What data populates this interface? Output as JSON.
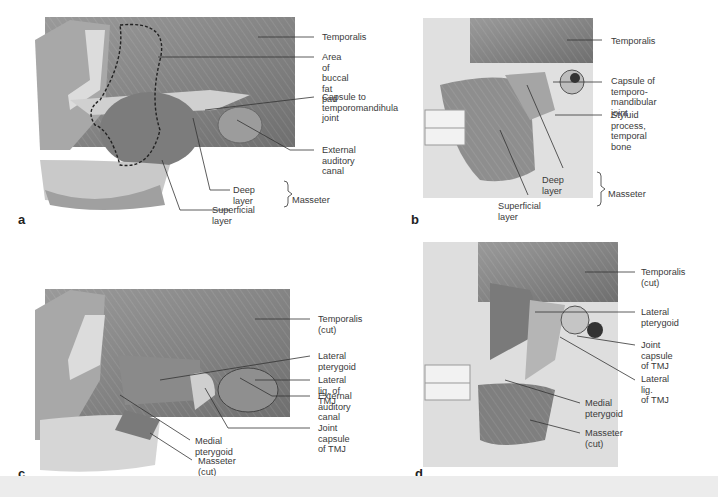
{
  "figure": {
    "panels": [
      {
        "letter": "a",
        "labels": {
          "temporalis": "Temporalis",
          "buccal": "Area of buccal\nfat pad",
          "capsule": "Capsule to\ntemporomandihula\njoint",
          "ear": "External auditory\ncanal",
          "deep": "Deep layer",
          "superficial": "Superficial layer",
          "masseter": "Masseter"
        }
      },
      {
        "letter": "b",
        "labels": {
          "temporalis": "Temporalis",
          "capsule": "Capsule of temporo-\nmandibular joint",
          "styloid": "Styluid process,\ntemporal bone",
          "deep": "Deep layer",
          "superficial": "Superficial layer",
          "masseter": "Masseter"
        }
      },
      {
        "letter": "c",
        "labels": {
          "temporalis": "Temporalis (cut)",
          "lat_pter": "Lateral pterygoid",
          "lat_lig": "Lateral lig. of TMJ",
          "ear": "External auditory\ncanal",
          "joint": "Joint capsule of TMJ",
          "med_pter": "Medial pterygoid",
          "masseter": "Masseter (cut)"
        }
      },
      {
        "letter": "d",
        "labels": {
          "temporalis": "Temporalis\n(cut)",
          "lat_pter": "Lateral\npterygoid",
          "joint": "Joint capsule\nof TMJ",
          "lat_lig": "Lateral lig.\nof TMJ",
          "med_pter": "Medial\npterygoid",
          "masseter": "Masseter (cut)"
        }
      }
    ],
    "colors": {
      "muscle": "#8a8a8a",
      "bone": "#d9d9d9",
      "dark": "#5a5a5a",
      "footer": "#ececec"
    }
  }
}
